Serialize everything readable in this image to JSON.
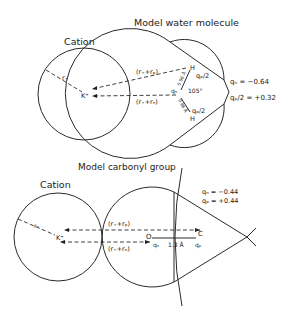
{
  "top": {
    "title": "Model water molecule",
    "cation_label": "Cation",
    "cation_symbol": "K⁺",
    "radius_label": "r₊",
    "upper_distance": "(r₊+rₚ)",
    "lower_distance": "(r₊+rₙ)",
    "bond_upper": "0.96 Å",
    "bond_lower": "0.96 Å",
    "angle": "105°",
    "qn_center": "qₙ",
    "h_upper": "H",
    "h_lower": "H",
    "qp_half_upper": "qₚ/2",
    "qp_half_lower": "qₚ/2",
    "charge_qn": "qₙ = −0.64",
    "charge_qp": "qₚ/2 = +0.32"
  },
  "bottom": {
    "title": "Model carbonyl group",
    "cation_label": "Cation",
    "cation_symbol": "K⁺",
    "radius_label": "r₊",
    "upper_distance": "(r₊+rₚ)",
    "lower_distance": "(r₊+rₙ)",
    "oxygen": "O",
    "carbon": "C",
    "qn": "qₙ",
    "qp": "qₚ",
    "bond_length": "1.3 Å",
    "charge_qn": "qₙ = −0.44",
    "charge_qp": "qₚ = +0.44"
  }
}
